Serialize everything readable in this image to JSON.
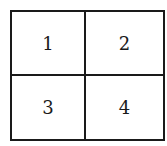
{
  "grid": {
    "cells": [
      {
        "label": "1"
      },
      {
        "label": "2"
      },
      {
        "label": "3"
      },
      {
        "label": "4"
      }
    ]
  },
  "colors": {
    "line": "#1a1a1a",
    "background": "#ffffff"
  }
}
